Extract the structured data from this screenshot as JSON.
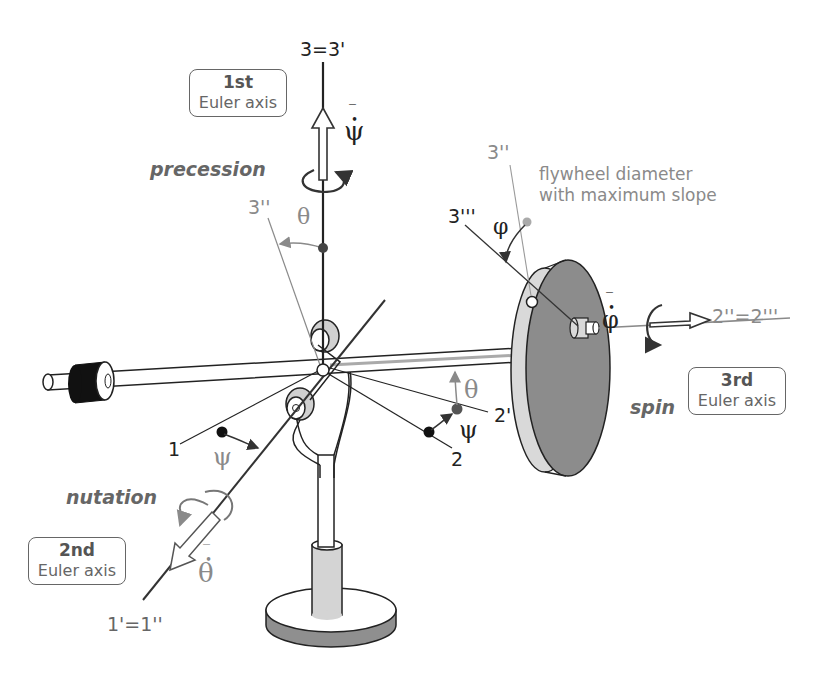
{
  "axes": {
    "first": {
      "ordinal": "1st",
      "name": "Euler axis",
      "motion": "precession",
      "rate_symbol": "ψ"
    },
    "second": {
      "ordinal": "2nd",
      "name": "Euler axis",
      "motion": "nutation",
      "rate_symbol": "θ"
    },
    "third": {
      "ordinal": "3rd",
      "name": "Euler axis",
      "motion": "spin",
      "rate_symbol": "φ"
    }
  },
  "axis_labels": {
    "top": "3=3'",
    "three_double_prime_left": "3''",
    "three_double_prime_right": "3''",
    "three_triple_prime": "3'''",
    "one": "1",
    "two": "2",
    "two_prime": "2'",
    "two_double_triple": "2''=2'''",
    "one_prime": "1'=1''"
  },
  "angle_labels": {
    "theta_top": "θ",
    "theta_right": "θ",
    "psi_left": "ψ",
    "psi_right": "ψ",
    "phi": "φ"
  },
  "annotation": {
    "line1": "flywheel diameter",
    "line2": "with maximum slope"
  },
  "colors": {
    "ink": "#222222",
    "grey_label": "#8a8a8a",
    "flywheel_face": "#8c8c8c",
    "flywheel_rim": "#d9d9d9",
    "counterweight": "#111111",
    "base_side": "#8f8f8f",
    "accent_fill": "#cfcfcf"
  }
}
